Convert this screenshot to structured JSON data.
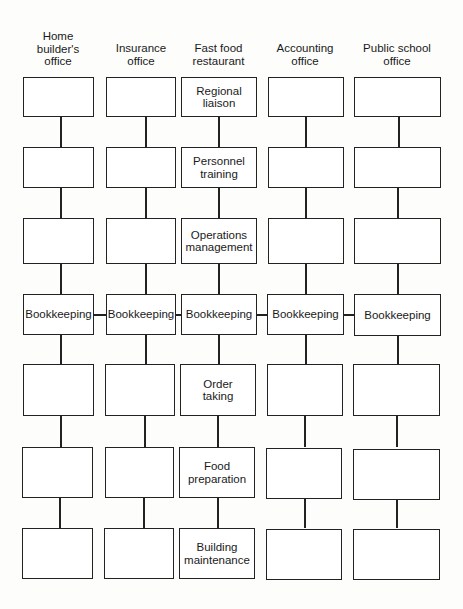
{
  "diagram": {
    "columns": [
      {
        "header": "Home\nbuilder's\noffice",
        "boxes": [
          "",
          "",
          "",
          "Bookkeeping",
          "",
          "",
          ""
        ]
      },
      {
        "header": "Insurance\noffice",
        "boxes": [
          "",
          "",
          "",
          "Bookkeeping",
          "",
          "",
          ""
        ]
      },
      {
        "header": "Fast food\nrestaurant",
        "boxes": [
          "Regional\nliaison",
          "Personnel\ntraining",
          "Operations\nmanagement",
          "Bookkeeping",
          "Order\ntaking",
          "Food\npreparation",
          "Building\nmaintenance"
        ]
      },
      {
        "header": "Accounting\noffice",
        "boxes": [
          "",
          "",
          "",
          "Bookkeeping",
          "",
          "",
          ""
        ]
      },
      {
        "header": "Public school\noffice",
        "boxes": [
          "",
          "",
          "",
          "Bookkeeping",
          "",
          "",
          ""
        ]
      }
    ],
    "shared_row_label": "Bookkeeping",
    "line_color": "#222222"
  }
}
